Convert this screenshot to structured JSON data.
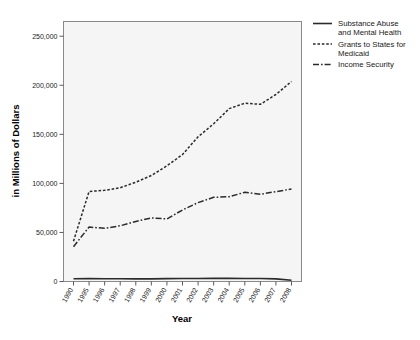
{
  "chart_data": {
    "type": "line",
    "title": "",
    "xlabel": "Year",
    "ylabel": "in Millions of Dollars",
    "categories": [
      "1990",
      "1995",
      "1996",
      "1997",
      "1998",
      "1999",
      "2000",
      "2001",
      "2002",
      "2003",
      "2004",
      "2005",
      "2006",
      "2007",
      "2008"
    ],
    "xtick_labels": [
      "1990",
      "1995",
      "1996",
      "1997",
      "1998",
      "1999",
      "2000",
      "2001",
      "2002",
      "2003",
      "2004",
      "2005",
      "2006",
      "2007",
      "2008"
    ],
    "ytick_labels": [
      "0",
      "50,000",
      "100,000",
      "150,000",
      "200,000",
      "250,000"
    ],
    "ytick_values": [
      0,
      50000,
      100000,
      150000,
      200000,
      250000
    ],
    "ylim": [
      0,
      265000
    ],
    "grid": false,
    "legend_position": "right",
    "series": [
      {
        "name": "Substance Abuse and Mental Health",
        "style": "solid",
        "values": [
          2800,
          2900,
          2800,
          2800,
          2700,
          2700,
          2900,
          3000,
          3100,
          3200,
          3200,
          3100,
          3000,
          2700,
          1200
        ]
      },
      {
        "name": "Grants to States for Medicaid",
        "style": "dotted",
        "values": [
          41100,
          91800,
          92900,
          95600,
          101200,
          108000,
          117900,
          129400,
          147500,
          160700,
          176200,
          181700,
          180600,
          190600,
          203900
        ]
      },
      {
        "name": "Income Security",
        "style": "dashdot",
        "values": [
          35500,
          55500,
          54200,
          56800,
          61200,
          64800,
          63800,
          72900,
          80400,
          85800,
          86400,
          90900,
          88900,
          91600,
          94200
        ]
      }
    ]
  },
  "legend": {
    "items": [
      {
        "label_line1": "Substance Abuse",
        "label_line2": "and Mental Health",
        "style": "solid"
      },
      {
        "label_line1": "Grants to States for",
        "label_line2": "Medicaid",
        "style": "dotted"
      },
      {
        "label_line1": "Income Security",
        "label_line2": "",
        "style": "dashdot"
      }
    ]
  },
  "colors": {
    "line": "#2b2b2b",
    "plot_background": "#f5f5f5",
    "frame": "#8a8a8a",
    "text": "#1a1a1a",
    "page_background": "#ffffff"
  }
}
